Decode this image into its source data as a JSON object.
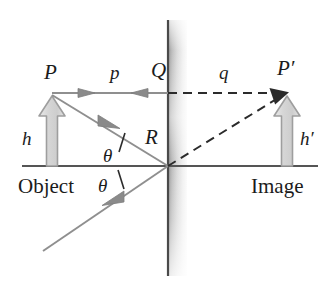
{
  "figure": {
    "kind": "ray-diagram",
    "background_color": "#ffffff"
  },
  "colors": {
    "ray": "#8a8a8a",
    "axis": "#555555",
    "mirror_line": "#4a4a4a",
    "mirror_glass_light": "#f2f2f2",
    "mirror_glass_dark": "#a8a8a8",
    "dashed": "#2b2b2b",
    "object_arrow_fill": "#d8d8d8",
    "object_arrow_stroke": "#9a9a9a",
    "text": "#1b1b1b"
  },
  "labels": {
    "object_point": "P",
    "image_point": "P′",
    "mirror_top_point": "Q",
    "mirror_vertex_point": "R",
    "object_distance": "p",
    "image_distance": "q",
    "object_height": "h",
    "image_height": "h′",
    "angle_incidence": "θ",
    "angle_reflection": "θ",
    "object_side": "Object",
    "image_side": "Image"
  },
  "geometry": {
    "axis": {
      "y": 166,
      "x_start": 22,
      "x_end": 318
    },
    "mirror": {
      "x": 168,
      "y_top": 20,
      "y_bottom": 276,
      "glass_width": 18
    },
    "object_point": {
      "x": 52,
      "y": 93
    },
    "image_point": {
      "x": 287,
      "y": 93
    },
    "mirror_top_point": {
      "x": 168,
      "y": 93
    },
    "mirror_vertex_point": {
      "x": 168,
      "y": 166
    },
    "object_arrow": {
      "x": 52,
      "base_y": 166,
      "tip_y": 96,
      "head_width": 26,
      "shaft_width": 11
    },
    "image_arrow": {
      "x": 287,
      "base_y": 166,
      "tip_y": 96,
      "head_width": 26,
      "shaft_width": 11
    },
    "incident_ray": {
      "from_x": 52,
      "from_y": 95,
      "to_x": 168,
      "to_y": 166
    },
    "reflected_ray": {
      "from_x": 168,
      "from_y": 166,
      "to_x": 43,
      "to_y": 251
    },
    "dashed_horizontal": {
      "from_x": 168,
      "from_y": 93,
      "to_x": 287,
      "to_y": 93
    },
    "dashed_diagonal": {
      "from_x": 168,
      "from_y": 166,
      "to_x": 287,
      "to_y": 93
    }
  },
  "label_positions": {
    "P": {
      "x": 44,
      "y": 62
    },
    "p": {
      "x": 110,
      "y": 62
    },
    "Q": {
      "x": 151,
      "y": 60
    },
    "q": {
      "x": 219,
      "y": 62
    },
    "Pprime": {
      "x": 278,
      "y": 58
    },
    "h": {
      "x": 22,
      "y": 129
    },
    "hprime": {
      "x": 300,
      "y": 129
    },
    "R": {
      "x": 145,
      "y": 127
    },
    "theta_upper": {
      "x": 103,
      "y": 146
    },
    "theta_lower": {
      "x": 98,
      "y": 176
    },
    "Object": {
      "x": 18,
      "y": 176
    },
    "Image": {
      "x": 251,
      "y": 176
    }
  }
}
